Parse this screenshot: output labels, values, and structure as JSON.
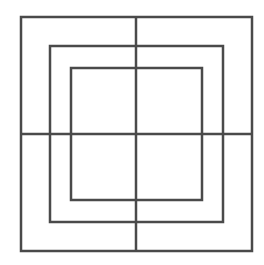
{
  "diagram": {
    "stroke_color": "#4a4a4a",
    "stroke_width": 2.5,
    "squares": [
      {
        "name": "outer",
        "x": 21,
        "y": 17,
        "w": 231,
        "h": 234
      },
      {
        "name": "middle",
        "x": 50,
        "y": 46,
        "w": 173,
        "h": 176
      },
      {
        "name": "inner",
        "x": 71,
        "y": 68,
        "w": 131,
        "h": 132
      }
    ],
    "lines": [
      {
        "name": "vertical",
        "x1": 136,
        "y1": 17,
        "x2": 136,
        "y2": 251
      },
      {
        "name": "horizontal",
        "x1": 21,
        "y1": 134,
        "x2": 252,
        "y2": 134
      }
    ]
  }
}
